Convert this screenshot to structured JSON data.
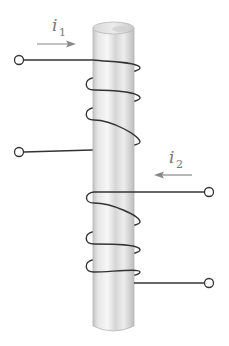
{
  "diagram": {
    "labels": {
      "i1": "i",
      "i1_sub": "1",
      "i2": "i",
      "i2_sub": "2"
    },
    "components": {
      "core": "cylindrical-core",
      "coil1": "coil-1",
      "coil2": "coil-2",
      "terminals": [
        "terminal-1a",
        "terminal-1b",
        "terminal-2a",
        "terminal-2b"
      ]
    },
    "arrows": {
      "i1_direction": "right",
      "i2_direction": "left"
    },
    "colors": {
      "wire": "#333333",
      "arrow": "#888888",
      "label": "#777777",
      "core_light": "#f2f2f2",
      "core_dark": "#bdbdbd"
    }
  }
}
